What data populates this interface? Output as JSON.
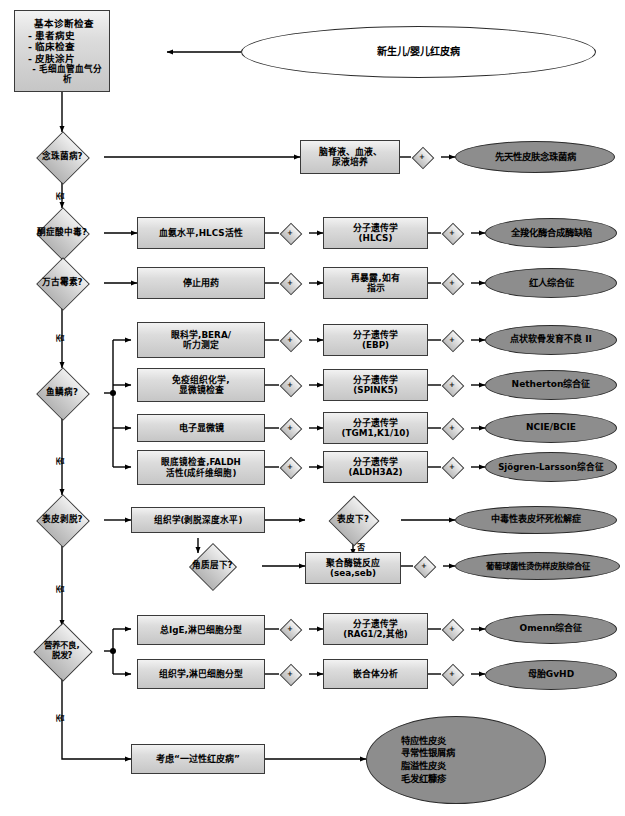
{
  "diagram": {
    "title_entry": "新生儿/婴儿红皮病",
    "basic_workup": {
      "heading": "基本诊断检查",
      "items": [
        "- 患者病史",
        "- 临床检查",
        "- 皮肤涂片",
        "- 毛细血管血气分析"
      ]
    },
    "no_label": "否",
    "plus_label": "+",
    "colors": {
      "outcome_fill": "#8d8d8d",
      "box_fill": "#dcdcdc",
      "border": "#3a3a3a",
      "line": "#000000"
    },
    "rows": [
      {
        "question": "念珠菌病?",
        "test1": [
          "脑脊液、血液、",
          "尿液培养"
        ],
        "outcome": "先天性皮肤念珠菌病"
      },
      {
        "question": "酮症酸中毒?",
        "test1": [
          "血氨水平,HLCS活性"
        ],
        "test2": [
          "分子遗传学",
          "(HLCS)"
        ],
        "outcome": "全羧化酶合成酶缺陷"
      },
      {
        "question": "万古霉素?",
        "test1": [
          "停止用药"
        ],
        "test2": [
          "再暴露,如有",
          "指示"
        ],
        "outcome": "红人综合征"
      },
      {
        "question": "鱼鳞病?",
        "branches": [
          {
            "test1": [
              "眼科学,BERA/",
              "听力测定"
            ],
            "test2": [
              "分子遗传学",
              "(EBP)"
            ],
            "outcome": "点状软骨发育不良 II"
          },
          {
            "test1": [
              "免疫组织化学,",
              "显微镜检查"
            ],
            "test2": [
              "分子遗传学",
              "(SPINK5)"
            ],
            "outcome": "Netherton综合征"
          },
          {
            "test1": [
              "电子显微镜"
            ],
            "test2": [
              "分子遗传学",
              "(TGM1,K1/10)"
            ],
            "outcome": "NCIE/BCIE"
          },
          {
            "test1": [
              "眼底镜检查,FALDH",
              "活性(成纤维细胞)"
            ],
            "test2": [
              "分子遗传学",
              "(ALDH3A2)"
            ],
            "outcome": "Sjögren-Larsson综合征"
          }
        ]
      },
      {
        "question": "表皮剥脱?",
        "test1": [
          "组织学(剥脱深度水平)"
        ],
        "decision2": "表皮下?",
        "outcome": "中毒性表皮坏死松解症",
        "decision3": "角质层下?",
        "test3": [
          "聚合酶链反应",
          "(sea,seb)"
        ],
        "outcome2": "葡萄球菌性烫伤样皮肤综合征"
      },
      {
        "question": "营养不良,\n脱发?",
        "question_lines": [
          "营养不良,",
          "脱发?"
        ],
        "branches": [
          {
            "test1": [
              "总IgE,淋巴细胞分型"
            ],
            "test2": [
              "分子遗传学",
              "(RAG1/2,其他)"
            ],
            "outcome": "Omenn综合征"
          },
          {
            "test1": [
              "组织学,淋巴细胞分型"
            ],
            "test2": [
              "嵌合体分析"
            ],
            "outcome": "母胎GvHD"
          }
        ]
      }
    ],
    "final": {
      "box": [
        "考虑“一过性红皮病”"
      ],
      "outcomes": [
        "特应性皮炎",
        "寻常性银屑病",
        "脂溢性皮炎",
        "毛发红糠疹"
      ]
    }
  }
}
